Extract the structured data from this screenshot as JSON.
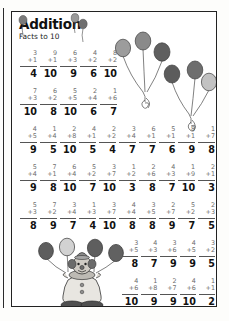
{
  "worksheet": {
    "title": "Addition",
    "subtitle": "Facts to 10"
  },
  "theme": {
    "paper": "#ffffff",
    "ink": "#111111",
    "rule": "#555555",
    "balloon_dark": "#6b6b6b",
    "balloon_mid": "#8f8f8f",
    "balloon_light": "#c9c9c9",
    "string": "#4a4a4a"
  },
  "art": {
    "top_bunch_left": "balloon-bunch-icon",
    "top_bunch_right": "balloon-bunch-icon",
    "clown": "clown-with-balloons-icon",
    "title_balloons": "small-balloons-icon"
  },
  "rows": [
    {
      "id": "row-1",
      "side": "left",
      "problems": [
        {
          "a": "3",
          "b": "+1",
          "sum": "4"
        },
        {
          "a": "9",
          "b": "+1",
          "sum": "10"
        },
        {
          "a": "6",
          "b": "+3",
          "sum": "9"
        },
        {
          "a": "4",
          "b": "+2",
          "sum": "6"
        },
        {
          "a": "8",
          "b": "+2",
          "sum": "10"
        }
      ]
    },
    {
      "id": "row-2",
      "side": "left",
      "problems": [
        {
          "a": "7",
          "b": "+3",
          "sum": "10"
        },
        {
          "a": "6",
          "b": "+2",
          "sum": "8"
        },
        {
          "a": "5",
          "b": "+5",
          "sum": "10"
        },
        {
          "a": "2",
          "b": "+4",
          "sum": "6"
        },
        {
          "a": "1",
          "b": "+6",
          "sum": "7"
        }
      ]
    },
    {
      "id": "row-3",
      "side": "full",
      "problems": [
        {
          "a": "4",
          "b": "+5",
          "sum": "9"
        },
        {
          "a": "1",
          "b": "+4",
          "sum": "5"
        },
        {
          "a": "2",
          "b": "+8",
          "sum": "10"
        },
        {
          "a": "4",
          "b": "+1",
          "sum": "5"
        },
        {
          "a": "2",
          "b": "+2",
          "sum": "4"
        },
        {
          "a": "3",
          "b": "+4",
          "sum": "7"
        },
        {
          "a": "6",
          "b": "+1",
          "sum": "7"
        },
        {
          "a": "5",
          "b": "+1",
          "sum": "6"
        },
        {
          "a": "8",
          "b": "+1",
          "sum": "9"
        },
        {
          "a": "1",
          "b": "+7",
          "sum": "8"
        }
      ]
    },
    {
      "id": "row-4",
      "side": "full",
      "problems": [
        {
          "a": "5",
          "b": "+4",
          "sum": "9"
        },
        {
          "a": "7",
          "b": "+1",
          "sum": "8"
        },
        {
          "a": "6",
          "b": "+4",
          "sum": "10"
        },
        {
          "a": "5",
          "b": "+2",
          "sum": "7"
        },
        {
          "a": "3",
          "b": "+7",
          "sum": "10"
        },
        {
          "a": "1",
          "b": "+2",
          "sum": "3"
        },
        {
          "a": "2",
          "b": "+6",
          "sum": "8"
        },
        {
          "a": "4",
          "b": "+3",
          "sum": "7"
        },
        {
          "a": "1",
          "b": "+9",
          "sum": "10"
        },
        {
          "a": "2",
          "b": "+1",
          "sum": "3"
        }
      ]
    },
    {
      "id": "row-5",
      "side": "full",
      "problems": [
        {
          "a": "5",
          "b": "+3",
          "sum": "8"
        },
        {
          "a": "7",
          "b": "+2",
          "sum": "9"
        },
        {
          "a": "3",
          "b": "+4",
          "sum": "7"
        },
        {
          "a": "1",
          "b": "+3",
          "sum": "4"
        },
        {
          "a": "3",
          "b": "+7",
          "sum": "10"
        },
        {
          "a": "4",
          "b": "+4",
          "sum": "8"
        },
        {
          "a": "3",
          "b": "+5",
          "sum": "8"
        },
        {
          "a": "2",
          "b": "+7",
          "sum": "9"
        },
        {
          "a": "5",
          "b": "+2",
          "sum": "7"
        },
        {
          "a": "2",
          "b": "+3",
          "sum": "5"
        }
      ]
    },
    {
      "id": "row-6",
      "side": "right",
      "problems": [
        {
          "a": "3",
          "b": "+5",
          "sum": "8"
        },
        {
          "a": "4",
          "b": "+3",
          "sum": "7"
        },
        {
          "a": "3",
          "b": "+6",
          "sum": "9"
        },
        {
          "a": "4",
          "b": "+5",
          "sum": "9"
        },
        {
          "a": "3",
          "b": "+2",
          "sum": "5"
        }
      ]
    },
    {
      "id": "row-7",
      "side": "right",
      "problems": [
        {
          "a": "4",
          "b": "+6",
          "sum": "10"
        },
        {
          "a": "1",
          "b": "+8",
          "sum": "9"
        },
        {
          "a": "2",
          "b": "+7",
          "sum": "9"
        },
        {
          "a": "4",
          "b": "+6",
          "sum": "10"
        },
        {
          "a": "1",
          "b": "+1",
          "sum": "2"
        }
      ]
    }
  ]
}
